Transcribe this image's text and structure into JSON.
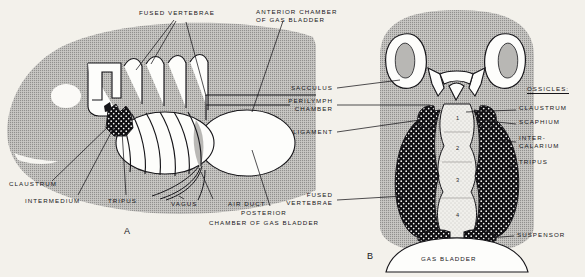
{
  "figure": {
    "panels": [
      {
        "id": "A",
        "letter": "A",
        "view": "lateral"
      },
      {
        "id": "B",
        "letter": "B",
        "view": "dorsal-section"
      }
    ],
    "colors": {
      "background": "#f3f1eb",
      "body_gray": "#a8a7a5",
      "body_gray_light": "#bcbbb8",
      "ink": "#17161a",
      "white_fill": "#ffffff",
      "stipple_dark": "#100f12",
      "pale_fill": "#efeeea"
    }
  },
  "panel_a": {
    "letter": "A",
    "labels": [
      {
        "name": "fused-vertebrae",
        "text": "FUSED VERTEBRAE",
        "x": 139,
        "y": 12,
        "align": "left"
      },
      {
        "name": "anterior-chamber-of-gas-bladder",
        "line1": "ANTERIOR CHAMBER",
        "line2": "OF GAS BLADDER",
        "x": 256,
        "y": 11,
        "align": "left"
      },
      {
        "name": "claustrum",
        "text": "CLAUSTRUM",
        "x": 9,
        "y": 182,
        "align": "left"
      },
      {
        "name": "intermedium",
        "text": "INTERMEDIUM",
        "x": 25,
        "y": 200,
        "align": "left"
      },
      {
        "name": "tripus",
        "text": "TRIPUS",
        "x": 108,
        "y": 200,
        "align": "left"
      },
      {
        "name": "vagus",
        "text": "VAGUS",
        "x": 171,
        "y": 203,
        "align": "left"
      },
      {
        "name": "air-duct",
        "text": "AIR DUCT",
        "x": 228,
        "y": 203,
        "align": "left"
      },
      {
        "name": "posterior-chamber-of-gas-bladder",
        "line1": "POSTERIOR",
        "line2": "CHAMBER OF GAS BLADDER",
        "x": 238,
        "y": 212,
        "align": "left"
      }
    ]
  },
  "panel_b": {
    "letter": "B",
    "ossicles_heading": "OSSICLES:",
    "labels_left": [
      {
        "name": "sacculus",
        "text": "SACCULUS",
        "x": 333,
        "y": 86,
        "align": "right"
      },
      {
        "name": "perilymph-chamber",
        "line1": "PERILYMPH",
        "line2": "CHAMBER",
        "x": 333,
        "y": 100,
        "align": "right"
      },
      {
        "name": "ligament",
        "text": "LIGAMENT",
        "x": 333,
        "y": 130,
        "align": "right"
      },
      {
        "name": "fused-vertebrae-b",
        "line1": "FUSED",
        "line2": "VERTEBRAE",
        "x": 333,
        "y": 194,
        "align": "right"
      }
    ],
    "labels_right": [
      {
        "name": "ossicles-heading",
        "text": "OSSICLES:",
        "x": 527,
        "y": 88,
        "align": "left"
      },
      {
        "name": "claustrum-b",
        "text": "CLAUSTRUM",
        "x": 519,
        "y": 107,
        "align": "left"
      },
      {
        "name": "scaphium",
        "text": "SCAPHIUM",
        "x": 519,
        "y": 121,
        "align": "left"
      },
      {
        "name": "intercalarium",
        "line1": "INTER-",
        "line2": "CALARIUM",
        "x": 519,
        "y": 137,
        "align": "left"
      },
      {
        "name": "tripus-b",
        "text": "TRIPUS",
        "x": 519,
        "y": 161,
        "align": "left"
      },
      {
        "name": "suspensor",
        "text": "SUSPENSOR",
        "x": 517,
        "y": 234,
        "align": "left"
      }
    ],
    "gas_bladder_label": {
      "name": "gas-bladder",
      "text": "GAS BLADDER",
      "x": 421,
      "y": 257
    },
    "vertebra_numbers": [
      {
        "n": "1",
        "x": 456,
        "y": 118
      },
      {
        "n": "2",
        "x": 456,
        "y": 148
      },
      {
        "n": "3",
        "x": 456,
        "y": 180
      },
      {
        "n": "4",
        "x": 456,
        "y": 215
      }
    ]
  }
}
